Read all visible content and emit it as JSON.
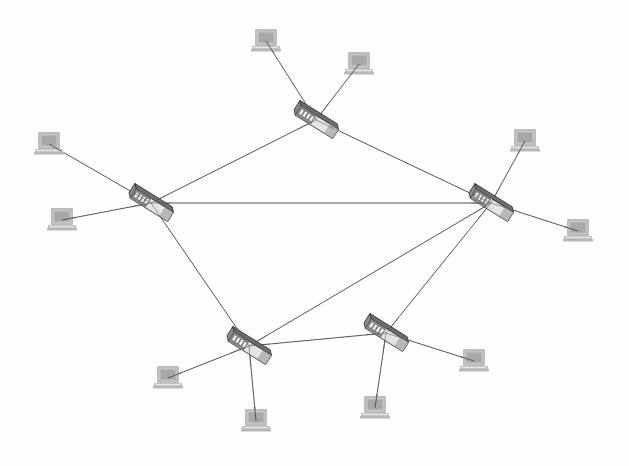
{
  "diagram": {
    "type": "network-topology",
    "width": 629,
    "height": 466,
    "colors": {
      "background": "#fefefe",
      "link": "#555555",
      "laptop_frame": "#bdbdbd",
      "laptop_screen": "#a8a8a8",
      "laptop_base": "#c4c4c4",
      "switch_top": "#6e6e6e",
      "switch_front": "#e4e4e4",
      "switch_side": "#8a8a8a",
      "switch_outline": "#333333",
      "switch_ports": "#f5f5f5"
    },
    "switches": [
      {
        "id": "S1",
        "label": "switch-top",
        "x": 316,
        "y": 120
      },
      {
        "id": "S2",
        "label": "switch-left",
        "x": 151,
        "y": 203
      },
      {
        "id": "S3",
        "label": "switch-right",
        "x": 491,
        "y": 203
      },
      {
        "id": "S4",
        "label": "switch-bottom-left",
        "x": 249,
        "y": 346
      },
      {
        "id": "S5",
        "label": "switch-bottom-right",
        "x": 386,
        "y": 333
      }
    ],
    "laptops": [
      {
        "id": "L1",
        "x": 266,
        "y": 43,
        "switch": "S1"
      },
      {
        "id": "L2",
        "x": 359,
        "y": 66,
        "switch": "S1"
      },
      {
        "id": "L3",
        "x": 49,
        "y": 146,
        "switch": "S2"
      },
      {
        "id": "L4",
        "x": 62,
        "y": 222,
        "switch": "S2"
      },
      {
        "id": "L5",
        "x": 525,
        "y": 143,
        "switch": "S3"
      },
      {
        "id": "L6",
        "x": 578,
        "y": 233,
        "switch": "S3"
      },
      {
        "id": "L7",
        "x": 168,
        "y": 380,
        "switch": "S4"
      },
      {
        "id": "L8",
        "x": 256,
        "y": 423,
        "switch": "S4"
      },
      {
        "id": "L9",
        "x": 375,
        "y": 410,
        "switch": "S5"
      },
      {
        "id": "L10",
        "x": 474,
        "y": 363,
        "switch": "S5"
      }
    ],
    "switch_links": [
      [
        "S1",
        "S2"
      ],
      [
        "S1",
        "S3"
      ],
      [
        "S2",
        "S3"
      ],
      [
        "S2",
        "S4"
      ],
      [
        "S4",
        "S3"
      ],
      [
        "S4",
        "S5"
      ],
      [
        "S5",
        "S3"
      ]
    ]
  }
}
